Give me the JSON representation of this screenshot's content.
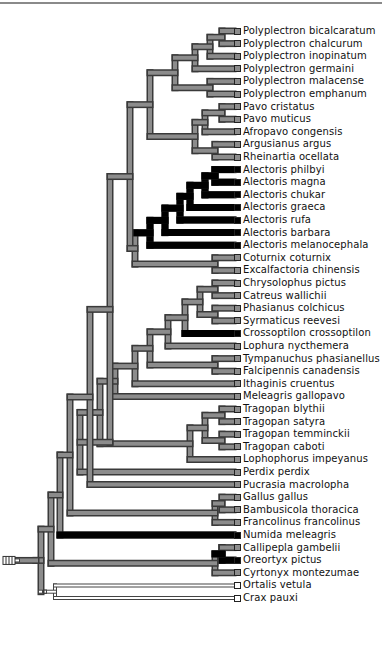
{
  "diagram": {
    "type": "phylogenetic-tree",
    "colors": {
      "gray": "#8c8c8c",
      "black": "#000000",
      "white": "#ffffff",
      "outline": "#3a3a3a"
    },
    "taxa": [
      {
        "name": "Polyplectron bicalcaratum",
        "state": "gray"
      },
      {
        "name": "Polyplectron chalcurum",
        "state": "gray"
      },
      {
        "name": "Polyplectron inopinatum",
        "state": "gray"
      },
      {
        "name": "Polyplectron germaini",
        "state": "gray"
      },
      {
        "name": "Polyplectron malacense",
        "state": "gray"
      },
      {
        "name": "Polyplectron emphanum",
        "state": "gray"
      },
      {
        "name": "Pavo cristatus",
        "state": "gray"
      },
      {
        "name": "Pavo muticus",
        "state": "gray"
      },
      {
        "name": "Afropavo congensis",
        "state": "gray"
      },
      {
        "name": "Argusianus argus",
        "state": "gray"
      },
      {
        "name": "Rheinartia ocellata",
        "state": "gray"
      },
      {
        "name": "Alectoris philbyi",
        "state": "black"
      },
      {
        "name": "Alectoris magna",
        "state": "black"
      },
      {
        "name": "Alectoris chukar",
        "state": "black"
      },
      {
        "name": "Alectoris graeca",
        "state": "black"
      },
      {
        "name": "Alectoris rufa",
        "state": "black"
      },
      {
        "name": "Alectoris barbara",
        "state": "black"
      },
      {
        "name": "Alectoris melanocephala",
        "state": "black"
      },
      {
        "name": "Coturnix coturnix",
        "state": "gray"
      },
      {
        "name": "Excalfactoria chinensis",
        "state": "gray"
      },
      {
        "name": "Chrysolophus pictus",
        "state": "gray"
      },
      {
        "name": "Catreus wallichii",
        "state": "gray"
      },
      {
        "name": "Phasianus colchicus",
        "state": "gray"
      },
      {
        "name": "Syrmaticus reevesi",
        "state": "gray"
      },
      {
        "name": "Crossoptilon crossoptilon",
        "state": "black"
      },
      {
        "name": "Lophura nycthemera",
        "state": "gray"
      },
      {
        "name": "Tympanuchus phasianellus",
        "state": "gray"
      },
      {
        "name": "Falcipennis canadensis",
        "state": "gray"
      },
      {
        "name": "Ithaginis cruentus",
        "state": "gray"
      },
      {
        "name": "Meleagris gallopavo",
        "state": "gray"
      },
      {
        "name": "Tragopan blythii",
        "state": "gray"
      },
      {
        "name": "Tragopan satyra",
        "state": "gray"
      },
      {
        "name": "Tragopan temminckii",
        "state": "gray"
      },
      {
        "name": "Tragopan caboti",
        "state": "gray"
      },
      {
        "name": "Lophophorus impeyanus",
        "state": "gray"
      },
      {
        "name": "Perdix perdix",
        "state": "gray"
      },
      {
        "name": "Pucrasia macrolopha",
        "state": "gray"
      },
      {
        "name": "Gallus gallus",
        "state": "gray"
      },
      {
        "name": "Bambusicola thoracica",
        "state": "gray"
      },
      {
        "name": "Francolinus francolinus",
        "state": "gray"
      },
      {
        "name": "Numida meleagris",
        "state": "black"
      },
      {
        "name": "Callipepla gambelii",
        "state": "gray"
      },
      {
        "name": "Oreortyx pictus",
        "state": "black"
      },
      {
        "name": "Cyrtonyx montezumae",
        "state": "gray"
      },
      {
        "name": "Ortalis vetula",
        "state": "white"
      },
      {
        "name": "Crax pauxi",
        "state": "white"
      }
    ]
  }
}
